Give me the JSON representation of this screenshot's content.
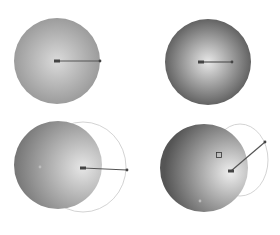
{
  "background": "#ffffff",
  "colors": {
    "dark": "#5a5a5a",
    "light": "#e6e6e6",
    "handle": "#555555",
    "arc": "#c8c8c8"
  },
  "panels": [
    {
      "id": "centered-gradient",
      "circle": {
        "cx": 57,
        "cy": 61,
        "r": 43
      },
      "gradient": {
        "fx": 0.5,
        "fy": 0.5,
        "inner": "#dadada",
        "outer": "#5e5e5e",
        "spread": 1.0
      },
      "handle": {
        "x1": 57,
        "y1": 61,
        "x2": 100,
        "y2": 61
      }
    },
    {
      "id": "small-center-highlight",
      "circle": {
        "cx": 208,
        "cy": 62,
        "r": 43
      },
      "gradient": {
        "fx": 0.5,
        "fy": 0.5,
        "inner": "#e8e8e8",
        "outer": "#555555",
        "spread": 0.55
      },
      "handle": {
        "x1": 201,
        "y1": 62,
        "x2": 232,
        "y2": 62
      }
    },
    {
      "id": "offset-focus-right",
      "circle": {
        "cx": 58,
        "cy": 165,
        "r": 44
      },
      "gradient": {
        "fx": 0.78,
        "fy": 0.53,
        "inner": "#e6e6e6",
        "outer": "#555555",
        "spread": 1.0
      },
      "arc": {
        "cx": 83,
        "cy": 167,
        "rx": 43,
        "ry": 45
      },
      "center_dot": {
        "x": 40,
        "y": 167
      },
      "handle": {
        "x1": 83,
        "y1": 168,
        "x2": 127,
        "y2": 170
      }
    },
    {
      "id": "angled-focus",
      "circle": {
        "cx": 204,
        "cy": 168,
        "r": 44
      },
      "gradient": {
        "fx": 0.8,
        "fy": 0.55,
        "inner": "#eeeeee",
        "outer": "#555555",
        "spread": 0.75
      },
      "arc": {
        "cx": 240,
        "cy": 160,
        "rx": 28,
        "ry": 36
      },
      "square_marker": {
        "x": 219,
        "y": 155
      },
      "center_dot": {
        "x": 200,
        "y": 201
      },
      "handle": {
        "x1": 231,
        "y1": 171,
        "x2": 265,
        "y2": 142
      }
    }
  ]
}
